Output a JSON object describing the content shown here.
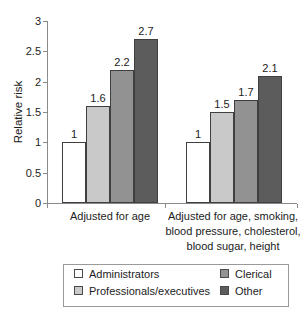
{
  "chart_data": {
    "type": "bar",
    "title": "",
    "xlabel": "",
    "ylabel": "Relative risk",
    "ylim": [
      0,
      3
    ],
    "yticks": [
      0,
      0.5,
      1,
      1.5,
      2,
      2.5,
      3
    ],
    "grid": false,
    "legend_position": "bottom",
    "categories": [
      [
        "Adjusted for age"
      ],
      [
        "Adjusted for age, smoking,",
        "blood pressure, cholesterol,",
        "blood sugar, height"
      ]
    ],
    "series": [
      {
        "name": "Administrators",
        "color": "#ffffff",
        "values": [
          1,
          1
        ]
      },
      {
        "name": "Professionals/executives",
        "color": "#c9c9c9",
        "values": [
          1.6,
          1.5
        ]
      },
      {
        "name": "Clerical",
        "color": "#929292",
        "values": [
          2.2,
          1.7
        ]
      },
      {
        "name": "Other",
        "color": "#5c5c5c",
        "values": [
          2.7,
          2.1
        ]
      }
    ],
    "bar_value_labels": [
      [
        "1",
        "1.6",
        "2.2",
        "2.7"
      ],
      [
        "1",
        "1.5",
        "1.7",
        "2.1"
      ]
    ],
    "colors": {
      "bar_border": "#3f3f3f",
      "axis": "#8a8a8a",
      "text": "#1c1c1c",
      "legend_border": "#9a9a9a"
    }
  }
}
